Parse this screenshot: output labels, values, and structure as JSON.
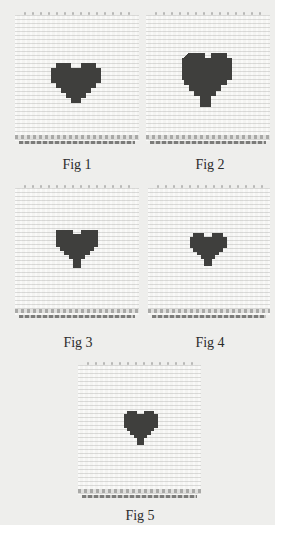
{
  "figures": [
    {
      "id": 1,
      "caption": "Fig 1",
      "motif": "heart-icon",
      "motif_color": "#3f3f3d"
    },
    {
      "id": 2,
      "caption": "Fig 2",
      "motif": "heart-icon",
      "motif_color": "#3f3f3d"
    },
    {
      "id": 3,
      "caption": "Fig 3",
      "motif": "heart-icon",
      "motif_color": "#3f3f3d"
    },
    {
      "id": 4,
      "caption": "Fig 4",
      "motif": "heart-icon",
      "motif_color": "#3f3f3d"
    },
    {
      "id": 5,
      "caption": "Fig 5",
      "motif": "heart-icon",
      "motif_color": "#3f3f3d"
    }
  ],
  "colors": {
    "page_background": "#eeeeec",
    "fabric": "#f4f4f2",
    "heart": "#3f3f3d",
    "caption_text": "#2a2a2a"
  }
}
